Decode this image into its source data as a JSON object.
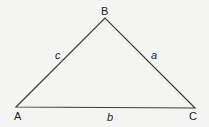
{
  "diagram": {
    "type": "triangle",
    "stroke_color": "#3a3a3a",
    "background": "#f4f4f2",
    "vertices": [
      {
        "name": "A",
        "x": 16,
        "y": 107
      },
      {
        "name": "B",
        "x": 105,
        "y": 18
      },
      {
        "name": "C",
        "x": 195,
        "y": 108
      }
    ],
    "vertex_labels": {
      "A": "A",
      "B": "B",
      "C": "C"
    },
    "side_labels": {
      "a": "a",
      "b": "b",
      "c": "c"
    }
  }
}
